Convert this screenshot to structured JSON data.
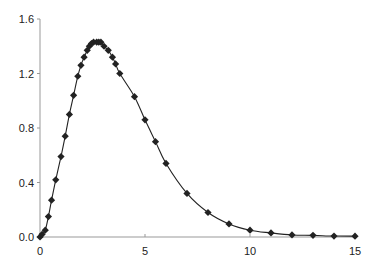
{
  "chart_data": {
    "type": "line",
    "title": "",
    "xlabel": "",
    "ylabel": "",
    "xlim": [
      0,
      15
    ],
    "ylim": [
      0,
      1.6
    ],
    "grid": false,
    "legend": null,
    "x_ticks": [
      "0",
      "5",
      "10",
      "15"
    ],
    "y_ticks": [
      "0.0",
      "0.4",
      "0.8",
      "1.2",
      "1.6"
    ],
    "series": [
      {
        "name": "series-1",
        "marker": "diamond",
        "line": "smooth",
        "color": "#222222",
        "x": [
          0,
          0.1,
          0.25,
          0.4,
          0.55,
          0.75,
          1.0,
          1.2,
          1.4,
          1.6,
          1.8,
          1.95,
          2.1,
          2.25,
          2.35,
          2.45,
          2.55,
          2.7,
          2.8,
          2.9,
          3.05,
          3.25,
          3.45,
          3.6,
          3.8,
          4.5,
          5.0,
          5.5,
          6.0,
          7.0,
          8.0,
          9.0,
          10.0,
          11.0,
          12.0,
          13.0,
          14.0,
          15.0
        ],
        "y": [
          0.0,
          0.02,
          0.05,
          0.15,
          0.27,
          0.42,
          0.59,
          0.74,
          0.9,
          1.04,
          1.18,
          1.26,
          1.32,
          1.37,
          1.4,
          1.42,
          1.43,
          1.43,
          1.43,
          1.43,
          1.4,
          1.37,
          1.32,
          1.27,
          1.2,
          1.03,
          0.86,
          0.7,
          0.54,
          0.32,
          0.18,
          0.096,
          0.05,
          0.03,
          0.015,
          0.012,
          0.007,
          0.006
        ]
      }
    ]
  }
}
